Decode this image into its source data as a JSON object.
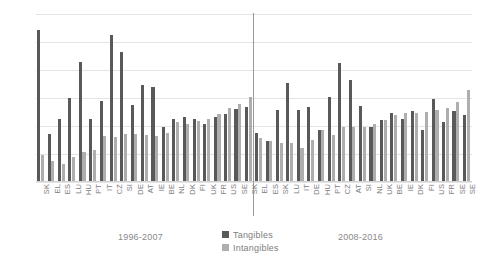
{
  "chart_data": {
    "type": "bar",
    "title": "",
    "xlabel": "",
    "ylabel": "",
    "ylim": [
      0,
      0.3
    ],
    "grid": true,
    "legend_position": "bottom-center",
    "ytick_labels": [
      ".00",
      ".05",
      ".10",
      ".15",
      ".20",
      ".25",
      ".30"
    ],
    "ytick_values": [
      0.0,
      0.05,
      0.1,
      0.15,
      0.2,
      0.25,
      0.3
    ],
    "series": [
      {
        "name": "Tangibles",
        "color": "#595959",
        "values": [
          0.272,
          0.086,
          0.112,
          0.15,
          0.214,
          0.113,
          0.145,
          0.262,
          0.232,
          0.137,
          0.174,
          0.17,
          0.098,
          0.113,
          0.116,
          0.113,
          0.104,
          0.116,
          0.122,
          0.131,
          0.134,
          0.088,
          0.073,
          0.129,
          0.176,
          0.128,
          0.134,
          0.093,
          0.152,
          0.212,
          0.183,
          0.136,
          0.098,
          0.11,
          0.124,
          0.112,
          0.127,
          0.092,
          0.148,
          0.107,
          0.127,
          0.12
        ]
      },
      {
        "name": "Intangibles",
        "color": "#aeaeae",
        "values": [
          0.048,
          0.038,
          0.032,
          0.044,
          0.053,
          0.057,
          0.083,
          0.081,
          0.086,
          0.086,
          0.084,
          0.083,
          0.087,
          0.107,
          0.104,
          0.109,
          0.113,
          0.122,
          0.133,
          0.139,
          0.152,
          0.078,
          0.074,
          0.07,
          0.069,
          0.06,
          0.075,
          0.092,
          0.084,
          0.099,
          0.098,
          0.099,
          0.104,
          0.111,
          0.119,
          0.124,
          0.124,
          0.125,
          0.128,
          0.133,
          0.142,
          0.165
        ]
      }
    ],
    "categories": [
      "SK",
      "EL",
      "ES",
      "LU",
      "HU",
      "PT",
      "IT",
      "CZ",
      "SI",
      "DE",
      "AT",
      "IE",
      "BE",
      "NL",
      "DK",
      "FI",
      "UK",
      "FR",
      "US",
      "SE",
      "SK",
      "EL",
      "ES",
      "SK",
      "LU",
      "IT",
      "DE",
      "HU",
      "PT",
      "CZ",
      "AT",
      "SI",
      "NL",
      "UK",
      "BE",
      "IE",
      "DK",
      "FI",
      "US",
      "FR",
      "SE",
      "SE"
    ],
    "groups": [
      {
        "label": "1996-2007",
        "start": 0,
        "end": 20
      },
      {
        "label": "2008-2016",
        "start": 21,
        "end": 41
      }
    ],
    "group_labels": [
      "1996-2007",
      "2008-2016"
    ],
    "legend": [
      {
        "label": "Tangibles",
        "color": "#595959"
      },
      {
        "label": "Intangibles",
        "color": "#aeaeae"
      }
    ]
  }
}
